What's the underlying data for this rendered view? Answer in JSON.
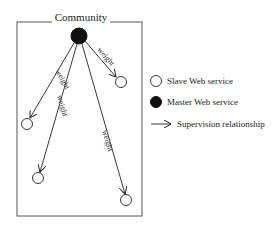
{
  "diagram": {
    "title": "Community",
    "edge_label": "weight",
    "master": {
      "label": "Master Web service",
      "cx": 79,
      "cy": 36,
      "r": 8
    },
    "slaves": [
      {
        "id": "s1",
        "cx": 27,
        "cy": 124,
        "r": 6
      },
      {
        "id": "s2",
        "cx": 38,
        "cy": 178,
        "r": 6
      },
      {
        "id": "s3",
        "cx": 121,
        "cy": 82,
        "r": 6
      },
      {
        "id": "s4",
        "cx": 126,
        "cy": 200,
        "r": 6
      }
    ],
    "edges": [
      {
        "from": "master",
        "to": "s3",
        "label": "weight"
      },
      {
        "from": "master",
        "to": "s1",
        "label": "weight"
      },
      {
        "from": "master",
        "to": "s2",
        "label": "weight"
      },
      {
        "from": "master",
        "to": "s4",
        "label": "weight"
      }
    ]
  },
  "legend": {
    "items": [
      {
        "symbol": "open-circle",
        "label": "Slave Web service"
      },
      {
        "symbol": "filled-circle",
        "label": "Master Web service"
      },
      {
        "symbol": "arrow",
        "label": "Supervision relationship"
      }
    ]
  },
  "colors": {
    "stroke": "#222222",
    "frame": "#555555",
    "fill_master": "#111111"
  }
}
